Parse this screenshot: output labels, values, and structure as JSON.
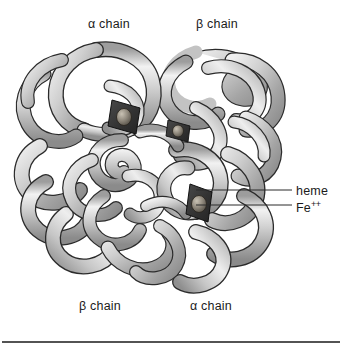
{
  "figure": {
    "background_color": "#ffffff",
    "ribbon_color_light": "#e2e2e2",
    "ribbon_color_mid": "#b9b9b9",
    "ribbon_color_dark": "#8f8f8f",
    "outline_color": "#2b2b2b",
    "heme_color": "#3a3a3a",
    "iron_color": "#8a8379",
    "label_color": "#1b1b1b",
    "leader_line_color": "#2b2b2b"
  },
  "labels": {
    "alpha_top": "α chain",
    "beta_top": "β chain",
    "beta_bottom": "β chain",
    "alpha_bottom": "α chain",
    "heme": "heme",
    "iron_symbol": "Fe",
    "iron_charge": "++"
  },
  "callouts": [
    {
      "name": "heme-callout",
      "label": "heme",
      "line_y": 190,
      "line_x_start": 196,
      "line_x_end": 292
    },
    {
      "name": "iron-callout",
      "label": "Fe++",
      "line_y": 205,
      "line_x_start": 196,
      "line_x_end": 292
    }
  ],
  "hemes": [
    {
      "name": "heme-upper-left",
      "x": 124,
      "y": 117
    },
    {
      "name": "heme-center",
      "x": 178,
      "y": 131
    },
    {
      "name": "heme-lower-right",
      "x": 199,
      "y": 206
    }
  ],
  "rule": {
    "name": "bottom-rule",
    "y": 342,
    "x_start": 2,
    "x_end": 340,
    "color": "#1a1a1a"
  }
}
